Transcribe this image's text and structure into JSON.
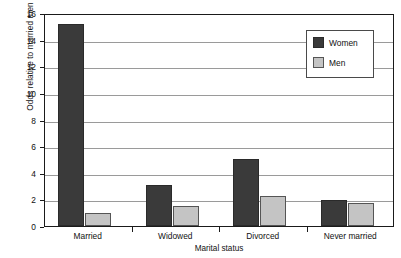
{
  "chart_data": {
    "type": "bar",
    "title": "",
    "xlabel": "Marital status",
    "ylabel": "Odds relative to married men",
    "categories": [
      "Married",
      "Widowed",
      "Divorced",
      "Never married"
    ],
    "series": [
      {
        "name": "Women",
        "color": "#3a3a3a",
        "values": [
          15.2,
          3.1,
          5.0,
          1.95
        ]
      },
      {
        "name": "Men",
        "color": "#c4c4c4",
        "values": [
          1.0,
          1.5,
          2.25,
          1.75
        ]
      }
    ],
    "ylim": [
      0,
      16
    ],
    "ytick_step": 2,
    "yticks": [
      0,
      2,
      4,
      6,
      8,
      10,
      12,
      14,
      16
    ],
    "ytick_labels": [
      "0",
      "2",
      "4",
      "6",
      "8",
      "10",
      "12",
      "14",
      "16"
    ],
    "grid": true,
    "grid_axis": "y",
    "legend_position": "top-right",
    "legend_entries": [
      "Women",
      "Men"
    ],
    "frame": true
  }
}
